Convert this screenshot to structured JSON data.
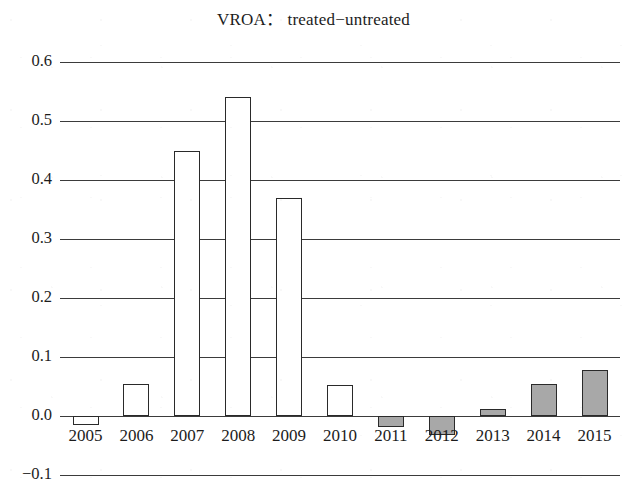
{
  "chart_data": {
    "type": "bar",
    "title": "VROA： treated−untreated",
    "xlabel": "",
    "ylabel": "",
    "categories": [
      "2005",
      "2006",
      "2007",
      "2008",
      "2009",
      "2010",
      "2011",
      "2012",
      "2013",
      "2014",
      "2015"
    ],
    "values": [
      -0.015,
      0.055,
      0.45,
      0.54,
      0.37,
      0.053,
      -0.018,
      -0.032,
      0.012,
      0.055,
      0.078
    ],
    "bar_styles": [
      "open",
      "open",
      "open",
      "open",
      "open",
      "open",
      "filled",
      "filled",
      "filled",
      "filled",
      "filled"
    ],
    "ylim": [
      -0.1,
      0.6
    ],
    "ytick_values": [
      0.6,
      0.5,
      0.4,
      0.3,
      0.2,
      0.1,
      0.0,
      -0.1
    ],
    "ytick_labels": [
      "0.6",
      "0.5",
      "0.4",
      "0.3",
      "0.2",
      "0.1",
      "0.0",
      "−0.1"
    ],
    "grid": true,
    "grid_axis": "y",
    "legend": null,
    "colors": {
      "open_bar_fill": "#ffffff",
      "filled_bar_fill": "#a8a8a8",
      "bar_edge": "#2a2a2a",
      "gridline": "#3b3b3b",
      "text": "#1c1c1c",
      "background": "#ffffff"
    }
  }
}
